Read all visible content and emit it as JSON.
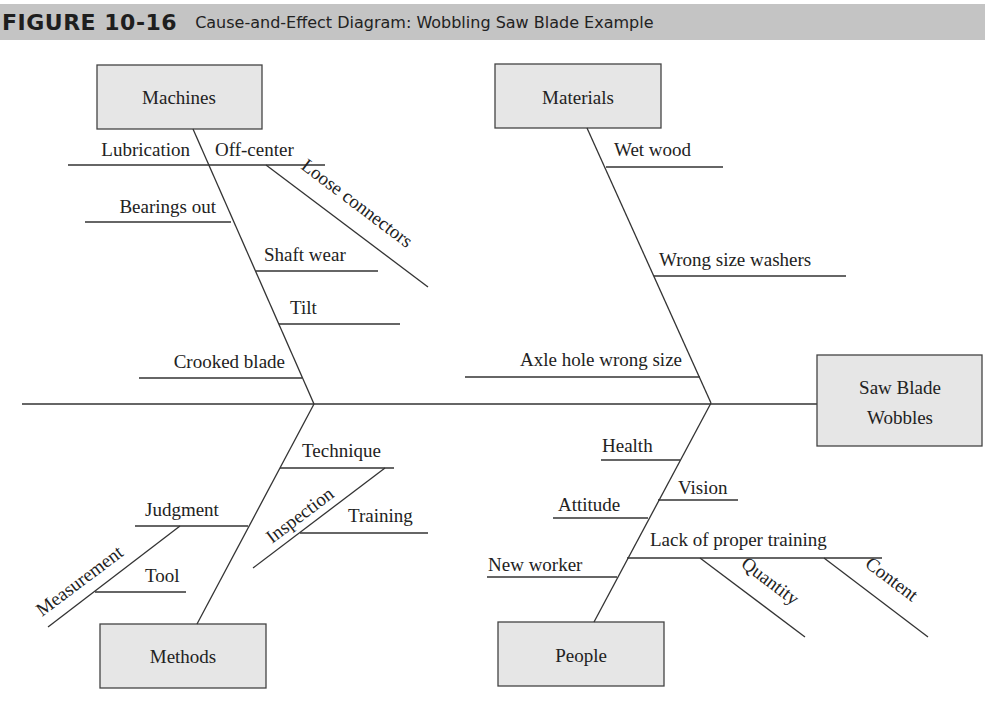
{
  "header": {
    "figure_number": "FIGURE 10-16",
    "title": "Cause-and-Effect Diagram: Wobbling Saw Blade Example",
    "background_color": "#c4c4c4"
  },
  "effect": {
    "line1": "Saw Blade",
    "line2": "Wobbles"
  },
  "categories": {
    "machines": {
      "label": "Machines",
      "causes": {
        "lubrication": "Lubrication",
        "off_center": "Off-center",
        "loose_connectors": "Loose connectors",
        "bearings_out": "Bearings out",
        "shaft_wear": "Shaft wear",
        "tilt": "Tilt",
        "crooked_blade": "Crooked blade"
      }
    },
    "materials": {
      "label": "Materials",
      "causes": {
        "wet_wood": "Wet wood",
        "wrong_size_washers": "Wrong size washers",
        "axle_hole_wrong_size": "Axle hole wrong size"
      }
    },
    "methods": {
      "label": "Methods",
      "causes": {
        "technique": "Technique",
        "inspection": "Inspection",
        "training": "Training",
        "judgment": "Judgment",
        "measurement": "Measurement",
        "tool": "Tool"
      }
    },
    "people": {
      "label": "People",
      "causes": {
        "health": "Health",
        "vision": "Vision",
        "attitude": "Attitude",
        "lack_of_proper_training": "Lack of proper training",
        "quantity": "Quantity",
        "content": "Content",
        "new_worker": "New worker"
      }
    }
  },
  "colors": {
    "box_fill": "#e6e6e6",
    "line": "#333333"
  }
}
